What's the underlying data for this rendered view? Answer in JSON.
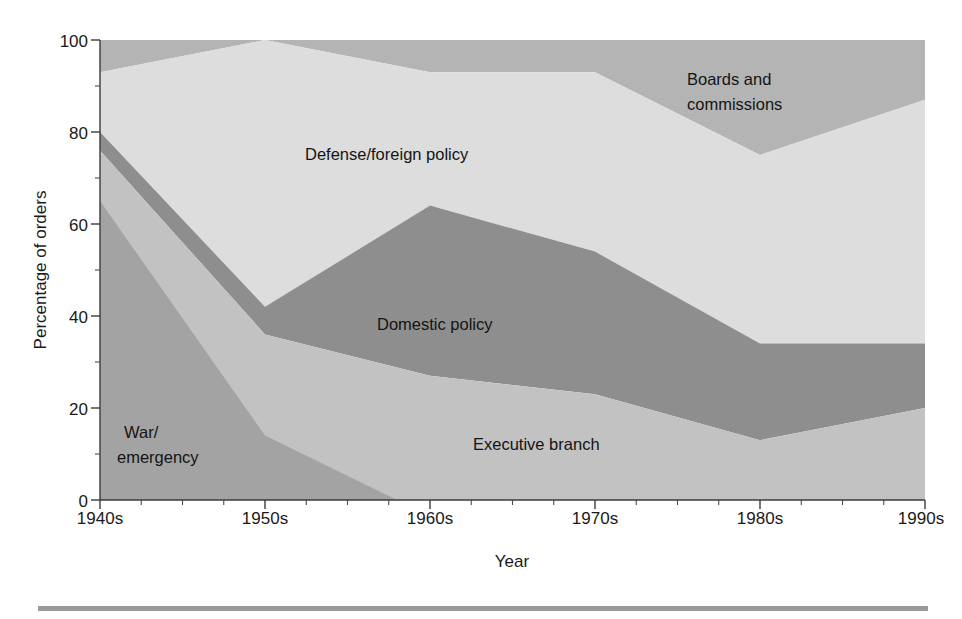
{
  "figure": {
    "background_color": "#ffffff",
    "bottom_rule_color": "#9a9a9a"
  },
  "axes": {
    "y_title": "Percentage of orders",
    "x_title": "Year",
    "y_ticks": [
      "0",
      "20",
      "40",
      "60",
      "80",
      "100"
    ],
    "x_ticks": [
      "1940s",
      "1950s",
      "1960s",
      "1970s",
      "1980s",
      "1990s"
    ]
  },
  "labels": {
    "war_emergency_line1": "War/",
    "war_emergency_line2": "emergency",
    "executive_branch": "Executive branch",
    "domestic_policy": "Domestic policy",
    "defense_foreign": "Defense/foreign policy",
    "boards_line1": "Boards and",
    "boards_line2": "commissions"
  },
  "chart_data": {
    "type": "area",
    "stacked": true,
    "title": "",
    "xlabel": "Year",
    "ylabel": "Percentage of orders",
    "categories": [
      "1940s",
      "1950s",
      "1960s",
      "1970s",
      "1980s",
      "1990s"
    ],
    "x": [
      1940,
      1950,
      1960,
      1970,
      1980,
      1990
    ],
    "ylim": [
      0,
      100
    ],
    "xlim": [
      1940,
      1990
    ],
    "ytick_values": [
      0,
      20,
      40,
      60,
      80,
      100
    ],
    "grid": false,
    "legend": "in-plot labels",
    "series": [
      {
        "name": "War/emergency",
        "color": "#a3a3a3",
        "values": [
          65,
          14,
          0,
          0,
          0,
          0
        ],
        "zero_crossing_x": 1958
      },
      {
        "name": "Executive branch",
        "color": "#c2c2c2",
        "values": [
          11,
          22,
          27,
          23,
          13,
          20
        ]
      },
      {
        "name": "Domestic policy",
        "color": "#8e8e8e",
        "values": [
          4,
          6,
          37,
          31,
          21,
          14
        ]
      },
      {
        "name": "Defense/foreign policy",
        "color": "#dddddd",
        "values": [
          13,
          58,
          29,
          39,
          41,
          53
        ]
      },
      {
        "name": "Boards and commissions",
        "color": "#b4b4b4",
        "values": [
          7,
          0,
          7,
          7,
          25,
          13
        ]
      }
    ],
    "cumulative_boundaries": {
      "war_emergency_top": [
        65,
        14,
        0,
        0,
        0,
        0
      ],
      "executive_branch_top": [
        76,
        36,
        27,
        23,
        13,
        20
      ],
      "domestic_policy_top": [
        80,
        42,
        64,
        54,
        34,
        34
      ],
      "defense_foreign_top": [
        93,
        100,
        93,
        93,
        75,
        87
      ],
      "boards_top": [
        100,
        100,
        100,
        100,
        100,
        100
      ]
    }
  }
}
